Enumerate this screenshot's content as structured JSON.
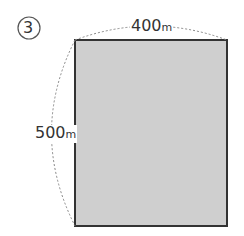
{
  "problem_number": "3",
  "shape": {
    "type": "rectangle",
    "fill": "#cfcfcf",
    "stroke": "#333333"
  },
  "dimensions": {
    "width": {
      "value": "400",
      "unit": "m"
    },
    "height": {
      "value": "500",
      "unit": "m"
    }
  }
}
